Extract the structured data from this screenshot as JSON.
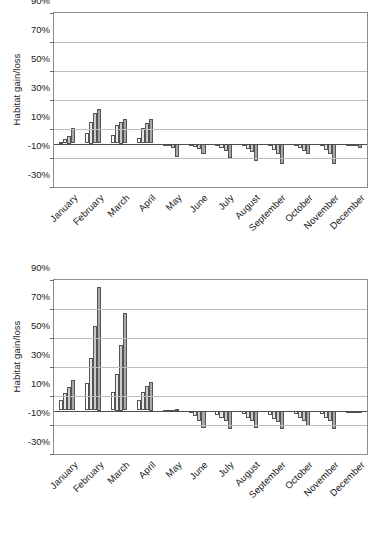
{
  "chart_data": [
    {
      "id": "top",
      "type": "bar",
      "title": "",
      "xlabel": "",
      "ylabel": "Habitat gain/loss",
      "ylim": [
        -30,
        90
      ],
      "yticks": [
        "90%",
        "70%",
        "50%",
        "30%",
        "10%",
        "-10%",
        "-30%"
      ],
      "ytick_values": [
        90,
        70,
        50,
        30,
        10,
        -10,
        -30
      ],
      "grid": true,
      "legend": "none",
      "categories": [
        "January",
        "February",
        "March",
        "April",
        "May",
        "June",
        "July",
        "August",
        "September",
        "October",
        "November",
        "December"
      ],
      "series": [
        {
          "name": "Series 1",
          "color": "#ffffff",
          "values": [
            1,
            7,
            6,
            4,
            -0.5,
            -1,
            -2,
            -2,
            -2,
            -1.5,
            -2,
            -1
          ]
        },
        {
          "name": "Series 2",
          "color": "#e8e8e8",
          "values": [
            3,
            15,
            13,
            11,
            -1.5,
            -2.5,
            -3,
            -4,
            -4.5,
            -3,
            -4.5,
            -1.5
          ]
        },
        {
          "name": "Series 3",
          "color": "#c9c9c9",
          "values": [
            5,
            21,
            15,
            14,
            -3,
            -4,
            -5,
            -6,
            -7,
            -5,
            -7,
            -2
          ]
        },
        {
          "name": "Series 4",
          "color": "#a8a8a8",
          "values": [
            11,
            24,
            17,
            17,
            -9,
            -7,
            -10,
            -12,
            -14,
            -7,
            -14,
            -3
          ]
        }
      ]
    },
    {
      "id": "bottom",
      "type": "bar",
      "title": "",
      "xlabel": "",
      "ylabel": "Habitat gain/loss",
      "ylim": [
        -30,
        90
      ],
      "yticks": [
        "90%",
        "70%",
        "50%",
        "30%",
        "10%",
        "-10%",
        "-30%"
      ],
      "ytick_values": [
        90,
        70,
        50,
        30,
        10,
        -10,
        -30
      ],
      "grid": true,
      "legend": "none",
      "categories": [
        "January",
        "February",
        "March",
        "April",
        "May",
        "June",
        "July",
        "August",
        "September",
        "October",
        "November",
        "December"
      ],
      "series": [
        {
          "name": "Series 1",
          "color": "#ffffff",
          "values": [
            7,
            19,
            13,
            7,
            0.3,
            -2,
            -3,
            -2.5,
            -3,
            -2.5,
            -2.5,
            -0.5
          ]
        },
        {
          "name": "Series 2",
          "color": "#e8e8e8",
          "values": [
            12,
            36,
            25,
            13,
            0.5,
            -4,
            -5,
            -5,
            -6,
            -5,
            -5,
            -1
          ]
        },
        {
          "name": "Series 3",
          "color": "#c9c9c9",
          "values": [
            16,
            58,
            45,
            17,
            0.6,
            -7,
            -7,
            -7,
            -8,
            -7,
            -7,
            -1.5
          ]
        },
        {
          "name": "Series 4",
          "color": "#a8a8a8",
          "values": [
            21,
            85,
            67,
            20,
            0.8,
            -12,
            -13,
            -12,
            -13,
            -11,
            -13,
            -1.5
          ]
        }
      ]
    }
  ]
}
